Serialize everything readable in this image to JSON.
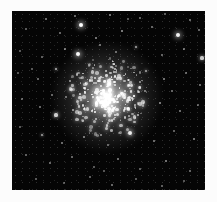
{
  "figure": {
    "kind": "astronomical-photograph",
    "caption": "",
    "plate": {
      "background_color": "#050505",
      "margin_color": "#fcfcfc",
      "star_color": "#ffffff",
      "left": 12,
      "top": 11,
      "width": 193,
      "height": 179
    },
    "cluster": {
      "center_x": 95,
      "center_y": 86,
      "halo_radius": 54,
      "core_radius": 22,
      "core_peak_brightness": 1.0
    }
  },
  "chart_data": {
    "type": "scatter",
    "title": "",
    "subtitle": "",
    "xlabel": "",
    "ylabel": "",
    "grid": false,
    "legend": null,
    "xlim": [
      0,
      193
    ],
    "ylim": [
      0,
      179
    ],
    "core_center": [
      95,
      86
    ],
    "halo_stars": [
      {
        "x": 34,
        "y": 8,
        "r": 1.0,
        "b": 0.55
      },
      {
        "x": 63,
        "y": 5,
        "r": 0.9,
        "b": 0.5
      },
      {
        "x": 98,
        "y": 4,
        "r": 1.1,
        "b": 0.6
      },
      {
        "x": 128,
        "y": 7,
        "r": 0.9,
        "b": 0.48
      },
      {
        "x": 153,
        "y": 3,
        "r": 0.8,
        "b": 0.42
      },
      {
        "x": 178,
        "y": 9,
        "r": 1.0,
        "b": 0.52
      },
      {
        "x": 14,
        "y": 18,
        "r": 0.9,
        "b": 0.45
      },
      {
        "x": 48,
        "y": 22,
        "r": 1.0,
        "b": 0.5
      },
      {
        "x": 69,
        "y": 14,
        "r": 2.4,
        "b": 1.0
      },
      {
        "x": 84,
        "y": 27,
        "r": 1.1,
        "b": 0.58
      },
      {
        "x": 110,
        "y": 20,
        "r": 1.2,
        "b": 0.62
      },
      {
        "x": 140,
        "y": 16,
        "r": 1.0,
        "b": 0.52
      },
      {
        "x": 166,
        "y": 24,
        "r": 2.2,
        "b": 0.95
      },
      {
        "x": 187,
        "y": 19,
        "r": 1.0,
        "b": 0.5
      },
      {
        "x": 8,
        "y": 40,
        "r": 0.9,
        "b": 0.44
      },
      {
        "x": 30,
        "y": 46,
        "r": 1.0,
        "b": 0.48
      },
      {
        "x": 53,
        "y": 38,
        "r": 1.2,
        "b": 0.6
      },
      {
        "x": 66,
        "y": 43,
        "r": 2.3,
        "b": 0.98
      },
      {
        "x": 88,
        "y": 34,
        "r": 1.1,
        "b": 0.56
      },
      {
        "x": 104,
        "y": 41,
        "r": 1.0,
        "b": 0.52
      },
      {
        "x": 124,
        "y": 36,
        "r": 1.3,
        "b": 0.66
      },
      {
        "x": 150,
        "y": 44,
        "r": 1.0,
        "b": 0.5
      },
      {
        "x": 172,
        "y": 38,
        "r": 1.1,
        "b": 0.55
      },
      {
        "x": 190,
        "y": 47,
        "r": 1.6,
        "b": 0.78
      },
      {
        "x": 6,
        "y": 62,
        "r": 0.9,
        "b": 0.42
      },
      {
        "x": 26,
        "y": 68,
        "r": 1.0,
        "b": 0.5
      },
      {
        "x": 44,
        "y": 58,
        "r": 1.4,
        "b": 0.7
      },
      {
        "x": 58,
        "y": 70,
        "r": 1.2,
        "b": 0.6
      },
      {
        "x": 134,
        "y": 60,
        "r": 1.3,
        "b": 0.64
      },
      {
        "x": 152,
        "y": 68,
        "r": 1.2,
        "b": 0.58
      },
      {
        "x": 174,
        "y": 62,
        "r": 1.0,
        "b": 0.5
      },
      {
        "x": 188,
        "y": 74,
        "r": 1.1,
        "b": 0.54
      },
      {
        "x": 10,
        "y": 88,
        "r": 1.0,
        "b": 0.46
      },
      {
        "x": 28,
        "y": 96,
        "r": 1.1,
        "b": 0.52
      },
      {
        "x": 44,
        "y": 104,
        "r": 1.6,
        "b": 0.8
      },
      {
        "x": 148,
        "y": 92,
        "r": 1.2,
        "b": 0.6
      },
      {
        "x": 168,
        "y": 100,
        "r": 1.1,
        "b": 0.54
      },
      {
        "x": 186,
        "y": 94,
        "r": 1.0,
        "b": 0.48
      },
      {
        "x": 8,
        "y": 116,
        "r": 0.9,
        "b": 0.44
      },
      {
        "x": 30,
        "y": 124,
        "r": 1.3,
        "b": 0.64
      },
      {
        "x": 50,
        "y": 132,
        "r": 1.1,
        "b": 0.54
      },
      {
        "x": 72,
        "y": 126,
        "r": 1.2,
        "b": 0.58
      },
      {
        "x": 96,
        "y": 134,
        "r": 1.0,
        "b": 0.5
      },
      {
        "x": 118,
        "y": 122,
        "r": 2.0,
        "b": 0.92
      },
      {
        "x": 142,
        "y": 130,
        "r": 1.1,
        "b": 0.54
      },
      {
        "x": 162,
        "y": 120,
        "r": 1.0,
        "b": 0.48
      },
      {
        "x": 182,
        "y": 128,
        "r": 1.2,
        "b": 0.58
      },
      {
        "x": 14,
        "y": 144,
        "r": 1.0,
        "b": 0.48
      },
      {
        "x": 38,
        "y": 152,
        "r": 1.1,
        "b": 0.52
      },
      {
        "x": 60,
        "y": 146,
        "r": 1.0,
        "b": 0.5
      },
      {
        "x": 82,
        "y": 156,
        "r": 0.9,
        "b": 0.44
      },
      {
        "x": 106,
        "y": 148,
        "r": 1.1,
        "b": 0.54
      },
      {
        "x": 128,
        "y": 158,
        "r": 1.0,
        "b": 0.48
      },
      {
        "x": 154,
        "y": 150,
        "r": 1.2,
        "b": 0.58
      },
      {
        "x": 178,
        "y": 160,
        "r": 1.0,
        "b": 0.5
      },
      {
        "x": 24,
        "y": 168,
        "r": 1.0,
        "b": 0.46
      },
      {
        "x": 52,
        "y": 172,
        "r": 0.9,
        "b": 0.42
      },
      {
        "x": 78,
        "y": 166,
        "r": 1.0,
        "b": 0.48
      },
      {
        "x": 100,
        "y": 174,
        "r": 1.1,
        "b": 0.52
      },
      {
        "x": 124,
        "y": 168,
        "r": 0.9,
        "b": 0.44
      },
      {
        "x": 150,
        "y": 175,
        "r": 1.0,
        "b": 0.48
      },
      {
        "x": 172,
        "y": 170,
        "r": 0.9,
        "b": 0.42
      },
      {
        "x": 40,
        "y": 84,
        "r": 1.0,
        "b": 0.5
      },
      {
        "x": 160,
        "y": 80,
        "r": 1.0,
        "b": 0.5
      },
      {
        "x": 92,
        "y": 160,
        "r": 0.9,
        "b": 0.42
      },
      {
        "x": 116,
        "y": 8,
        "r": 0.8,
        "b": 0.4
      },
      {
        "x": 20,
        "y": 58,
        "r": 0.8,
        "b": 0.4
      },
      {
        "x": 196,
        "y": 110,
        "r": 0.9,
        "b": 0.44
      }
    ],
    "core_star_count": 320,
    "core_radius": 40,
    "core_concentration": 2.1
  }
}
